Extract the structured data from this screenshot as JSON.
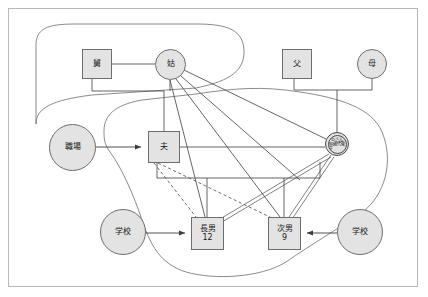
{
  "diagram": {
    "type": "genogram-ecomap",
    "title": "",
    "colors": {
      "node_fill": "#e3e3e3",
      "node_stroke": "#6d6d6d",
      "link_stroke": "#4a4a4a",
      "boundary_stroke": "#6d6d6d",
      "frame_stroke": "#b9b9b9",
      "background": "#ffffff"
    },
    "nodes": [
      {
        "id": "father_in_law",
        "label": "舅",
        "sub": "",
        "shape": "square",
        "x": 82,
        "y": 49,
        "w": 30,
        "h": 30,
        "font": 8
      },
      {
        "id": "mother_in_law",
        "label": "姑",
        "sub": "",
        "shape": "circle",
        "x": 155,
        "y": 49,
        "w": 31,
        "h": 31,
        "font": 8
      },
      {
        "id": "father",
        "label": "父",
        "sub": "",
        "shape": "square",
        "x": 282,
        "y": 49,
        "w": 30,
        "h": 30,
        "font": 8
      },
      {
        "id": "mother",
        "label": "母",
        "sub": "",
        "shape": "circle",
        "x": 357,
        "y": 49,
        "w": 30,
        "h": 30,
        "font": 8
      },
      {
        "id": "workplace",
        "label": "職場",
        "sub": "",
        "shape": "circle",
        "x": 49,
        "y": 124,
        "w": 47,
        "h": 47,
        "font": 8
      },
      {
        "id": "husband",
        "label": "夫",
        "sub": "",
        "shape": "square",
        "x": 148,
        "y": 131,
        "w": 32,
        "h": 32,
        "font": 8
      },
      {
        "id": "school_left",
        "label": "学校",
        "sub": "",
        "shape": "circle",
        "x": 100,
        "y": 209,
        "w": 46,
        "h": 46,
        "font": 8
      },
      {
        "id": "eldest_son",
        "label": "長男",
        "sub": "12",
        "shape": "square",
        "x": 191,
        "y": 217,
        "w": 33,
        "h": 33,
        "font": 8
      },
      {
        "id": "second_son",
        "label": "次男",
        "sub": "9",
        "shape": "square",
        "x": 268,
        "y": 217,
        "w": 33,
        "h": 33,
        "font": 8
      },
      {
        "id": "school_right",
        "label": "学校",
        "sub": "",
        "shape": "circle",
        "x": 337,
        "y": 209,
        "w": 46,
        "h": 46,
        "font": 8
      }
    ],
    "identified_person": {
      "id": "client_d",
      "name": "Dさん",
      "age_label": "30歳代後半",
      "shape": "double-circle",
      "cx": 337,
      "cy": 144,
      "outer_r": 12,
      "inner_r": 9.5
    },
    "edges": [
      {
        "from": "father_in_law",
        "to": "mother_in_law",
        "style": "solid",
        "desc": "marriage line"
      },
      {
        "from": "father_in_law",
        "to": "husband",
        "style": "solid",
        "desc": "parent-child bracket"
      },
      {
        "from": "mother_in_law",
        "to": "husband",
        "style": "solid",
        "desc": "parent-child bracket"
      },
      {
        "from": "father",
        "to": "client_d",
        "style": "solid",
        "desc": "parent-child bracket"
      },
      {
        "from": "mother",
        "to": "client_d",
        "style": "solid",
        "desc": "parent-child bracket"
      },
      {
        "from": "husband",
        "to": "client_d",
        "style": "solid",
        "desc": "marriage line"
      },
      {
        "from": "husband",
        "to": "eldest_son",
        "style": "dashed",
        "desc": "weak relationship"
      },
      {
        "from": "husband",
        "to": "second_son",
        "style": "dashed",
        "desc": "weak relationship"
      },
      {
        "from": "client_d",
        "to": "eldest_son",
        "style": "double",
        "desc": "strong relationship"
      },
      {
        "from": "client_d",
        "to": "second_son",
        "style": "double",
        "desc": "strong relationship"
      },
      {
        "from": "mother_in_law",
        "to": "eldest_son",
        "style": "solid",
        "desc": "relationship"
      },
      {
        "from": "mother_in_law",
        "to": "second_son",
        "style": "solid",
        "desc": "relationship"
      },
      {
        "from": "mother_in_law",
        "to": "client_d",
        "style": "solid",
        "desc": "relationship"
      },
      {
        "from": "workplace",
        "to": "husband",
        "style": "arrow",
        "desc": "resource arrow"
      },
      {
        "from": "school_left",
        "to": "eldest_son",
        "style": "arrow",
        "desc": "resource arrow"
      },
      {
        "from": "school_right",
        "to": "second_son",
        "style": "arrow",
        "desc": "resource arrow"
      }
    ],
    "boundaries": [
      {
        "id": "extended_family_boundary",
        "desc": "upper-left rounded enclosure around 舅 and 姑"
      },
      {
        "id": "household_boundary",
        "desc": "large rounded enclosure around 夫, Dさん, 長男, 次男"
      }
    ]
  }
}
